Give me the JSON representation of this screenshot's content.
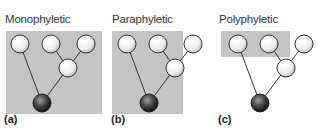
{
  "colors": {
    "highlight_box": "#c4c4c4",
    "edge": "#333333",
    "leaf_fill": "#f0f0f0",
    "root_fill": "#3a3a3a"
  },
  "panels": [
    {
      "label": "(a)",
      "title": "Monophyletic",
      "grouping": "ancestor and all descendants"
    },
    {
      "label": "(b)",
      "title": "Paraphyletic",
      "grouping": "ancestor and some descendants"
    },
    {
      "label": "(c)",
      "title": "Polyphyletic",
      "grouping": "taxa without common ancestor"
    }
  ]
}
